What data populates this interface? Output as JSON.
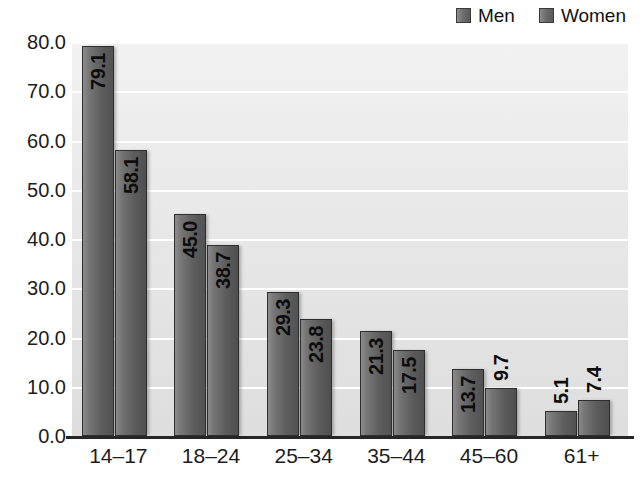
{
  "chart_data": {
    "type": "bar",
    "title": "",
    "subtitle": "",
    "xlabel": "",
    "ylabel": "",
    "grid": true,
    "legend_position": "top-right",
    "categories": [
      "14–17",
      "18–24",
      "25–34",
      "35–44",
      "45–60",
      "61+"
    ],
    "ylim": [
      0.0,
      80.0
    ],
    "ytick_labels": [
      "80.0",
      "70.0",
      "60.0",
      "50.0",
      "40.0",
      "30.0",
      "20.0",
      "10.0",
      "0.0"
    ],
    "ytick_values": [
      80.0,
      70.0,
      60.0,
      50.0,
      40.0,
      30.0,
      20.0,
      10.0,
      0.0
    ],
    "series": [
      {
        "name": "Men",
        "color": "#6e6e6e",
        "values": [
          79.1,
          45.0,
          29.3,
          21.3,
          13.7,
          5.1
        ],
        "labels": [
          "79.1",
          "45.0",
          "29.3",
          "21.3",
          "13.7",
          "5.1"
        ],
        "label_placement": [
          "inside",
          "inside",
          "inside",
          "inside",
          "inside",
          "outside"
        ]
      },
      {
        "name": "Women",
        "color": "#6a6a6a",
        "values": [
          58.1,
          38.7,
          23.8,
          17.5,
          9.7,
          7.4
        ],
        "labels": [
          "58.1",
          "38.7",
          "23.8",
          "17.5",
          "9.7",
          "7.4"
        ],
        "label_placement": [
          "inside",
          "inside",
          "inside",
          "inside",
          "outside",
          "outside"
        ]
      }
    ]
  },
  "legend": {
    "entries": [
      {
        "label": "Men",
        "swatch": "men-legend-swatch"
      },
      {
        "label": "Women",
        "swatch": "women-legend-swatch"
      }
    ]
  },
  "colors": {
    "plot_background": "#e9e9e9",
    "gridline": "#ffffff",
    "axis": "#262626",
    "text": "#1c1c1c",
    "bar_men": "#6e6e6e",
    "bar_women": "#6a6a6a"
  }
}
